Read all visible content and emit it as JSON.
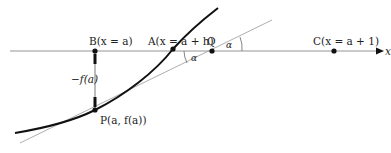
{
  "diagram": {
    "title": "",
    "axis": {
      "label": "x"
    },
    "points": {
      "B": {
        "label": "B(x = a)"
      },
      "A": {
        "label": "A(x = a + h)"
      },
      "Q": {
        "label": "Q"
      },
      "C": {
        "label": "C(x = a + 1)"
      },
      "P": {
        "label": "P(a, f(a))"
      }
    },
    "annotations": {
      "neg_fa": "−f(a)",
      "alpha_1": "α",
      "alpha_2": "α"
    },
    "colors": {
      "curve": "#111111",
      "axis": "#888888",
      "tangent": "#999999",
      "point": "#111111"
    }
  }
}
